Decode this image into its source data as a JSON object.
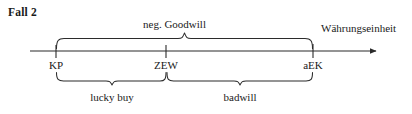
{
  "title": "Fall 2",
  "axis": {
    "unit_label": "Währungseinheit",
    "ticks": [
      {
        "id": "kp",
        "label": "KP",
        "x": 56
      },
      {
        "id": "zew",
        "label": "ZEW",
        "x": 166
      },
      {
        "id": "aek",
        "label": "aEK",
        "x": 313
      }
    ],
    "line_color": "#2b2b2b",
    "start_x": 30,
    "end_x": 381,
    "y": 51
  },
  "braces": {
    "top": {
      "label": "neg. Goodwill",
      "from": "KP",
      "to": "aEK",
      "from_x": 56,
      "to_x": 313
    },
    "bottom": [
      {
        "label": "lucky buy",
        "from": "KP",
        "to": "ZEW",
        "from_x": 56,
        "to_x": 166
      },
      {
        "label": "badwill",
        "from": "ZEW",
        "to": "aEK",
        "from_x": 166,
        "to_x": 313
      }
    ]
  },
  "colors": {
    "ink": "#1a1a1a",
    "line": "#2b2b2b",
    "background": "#ffffff"
  }
}
